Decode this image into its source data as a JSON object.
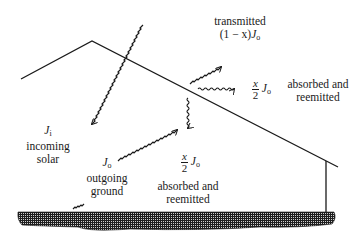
{
  "diagram": {
    "type": "greenhouse-radiation-balance",
    "colors": {
      "line": "#1a1a1a",
      "ground": "#2a2a2a",
      "background": "#ffffff"
    },
    "labels": {
      "transmitted": {
        "line1": "transmitted",
        "coef": "(1 − x)",
        "symbol": "J",
        "sub": "o"
      },
      "absorbed_right": {
        "frac_num": "x",
        "frac_den": "2",
        "symbol": "J",
        "sub": "o",
        "line1": "absorbed and",
        "line2": "reemitted"
      },
      "absorbed_down": {
        "frac_num": "x",
        "frac_den": "2",
        "symbol": "J",
        "sub": "o",
        "line1": "absorbed and",
        "line2": "reemitted"
      },
      "incoming": {
        "symbol": "J",
        "sub": "i",
        "line1": "incoming",
        "line2": "solar"
      },
      "outgoing": {
        "symbol": "J",
        "sub": "o",
        "line1": "outgoing",
        "line2": "ground"
      }
    },
    "elements": [
      "roof",
      "wall",
      "ground",
      "incoming-solar-ray",
      "outgoing-ground-ray",
      "transmitted-ray",
      "reemitted-right-ray",
      "reemitted-down-ray"
    ]
  }
}
